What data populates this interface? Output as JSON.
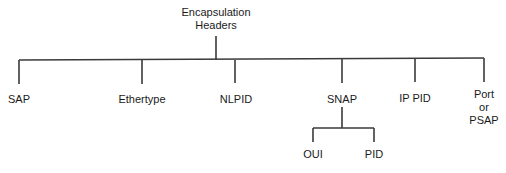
{
  "diagram": {
    "type": "tree",
    "root": {
      "label_line1": "Encapsulation",
      "label_line2": "Headers"
    },
    "children": [
      {
        "label": "SAP"
      },
      {
        "label": "Ethertype"
      },
      {
        "label": "NLPID"
      },
      {
        "label": "SNAP",
        "children": [
          {
            "label": "OUI"
          },
          {
            "label": "PID"
          }
        ]
      },
      {
        "label": "IP PID"
      },
      {
        "label_line1": "Port",
        "label_line2": "or",
        "label_line3": "PSAP"
      }
    ],
    "line_color": "#3a3a3a"
  }
}
